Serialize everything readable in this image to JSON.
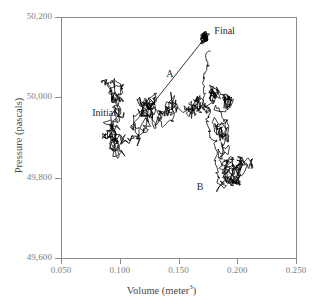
{
  "chart_data": {
    "type": "scatter",
    "title": "",
    "xlabel": "Volume (meter3)",
    "xlabel_base": "Volume (meter",
    "xlabel_exponent": "3",
    "xlabel_close": ")",
    "ylabel": "Pressure (pascals)",
    "xlim": [
      0.05,
      0.25
    ],
    "ylim": [
      49600,
      50200
    ],
    "grid": false,
    "legend": "none",
    "x_ticks": [
      0.05,
      0.1,
      0.15,
      0.2,
      0.25
    ],
    "x_tick_labels": [
      "0.050",
      "0.100",
      "0.150",
      "0.200",
      "0.250"
    ],
    "y_ticks": [
      49600,
      49800,
      50000,
      50200
    ],
    "y_tick_labels": [
      "49,600",
      "49,800",
      "50,000",
      "50,200"
    ],
    "series": [
      {
        "name": "random-walk trajectory",
        "kind": "path",
        "color": "#000000",
        "description": "Brownian random walk of a gas between Initial and Final states",
        "start": [
          0.095,
          50000
        ],
        "end": [
          0.172,
          50150
        ],
        "n_steps": 1400,
        "step_scale": [
          0.0022,
          9.5
        ]
      },
      {
        "name": "A",
        "kind": "straight-line",
        "color": "#000000",
        "points": [
          [
            0.1265,
            49978
          ],
          [
            0.1725,
            50148
          ]
        ]
      }
    ],
    "annotations": [
      {
        "label": "Initial",
        "x": 0.0765,
        "y": 49958,
        "name": "initial-label"
      },
      {
        "label": "Final",
        "x": 0.1805,
        "y": 50162,
        "name": "final-label"
      },
      {
        "label": "A",
        "x": 0.1395,
        "y": 50055,
        "name": "path-a-label"
      },
      {
        "label": "B",
        "x": 0.1655,
        "y": 49775,
        "name": "path-b-label"
      }
    ],
    "clusters": [
      {
        "name": "initial-cluster",
        "center": [
          0.098,
          50000
        ],
        "density": "moderate"
      },
      {
        "name": "final-blob",
        "center": [
          0.172,
          50148
        ],
        "density": "dense"
      },
      {
        "name": "b-cluster",
        "center": [
          0.19,
          49830
        ],
        "density": "very-dense"
      }
    ]
  },
  "style": {
    "axis_color": "#8a8a8a",
    "trace_color": "#000000",
    "tick_label_color": "#7d7d7d",
    "axis_title_color": "#4a4a4a",
    "background": "#ffffff"
  }
}
